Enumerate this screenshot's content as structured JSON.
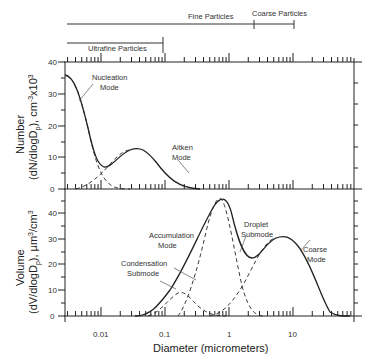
{
  "chart_data": [
    {
      "type": "line",
      "title": "",
      "panel": "number",
      "ylabel_line1": "Number",
      "ylabel_line2": "(dN/dlogDp), cm-3x10^3",
      "xlabel": "",
      "xscale": "log",
      "xlim": [
        0.00275,
        90
      ],
      "ylim": [
        0,
        40
      ],
      "yticks": [
        0,
        10,
        20,
        30,
        40
      ],
      "series": [
        {
          "name": "Total (solid)",
          "x": [
            0.003,
            0.005,
            0.007,
            0.01,
            0.015,
            0.02,
            0.03,
            0.05,
            0.1,
            0.2
          ],
          "y": [
            35,
            27,
            14,
            7,
            9,
            11.5,
            12.5,
            8,
            1.5,
            0
          ]
        },
        {
          "name": "Nucleation Mode (dashed)",
          "x": [
            0.003,
            0.005,
            0.007,
            0.01,
            0.015,
            0.02
          ],
          "y": [
            35,
            27,
            13,
            4,
            1,
            0
          ]
        },
        {
          "name": "Aitken Mode (dashed)",
          "x": [
            0.005,
            0.01,
            0.015,
            0.02,
            0.03,
            0.05,
            0.1
          ],
          "y": [
            0,
            3,
            8,
            11,
            12.5,
            8,
            1.5
          ]
        }
      ],
      "annotations": [
        "Nucleation Mode",
        "Aitken Mode"
      ]
    },
    {
      "type": "line",
      "panel": "volume",
      "ylabel_line1": "Volume",
      "ylabel_line2": "(dV/dlogDp), µm3/cm3",
      "xlabel": "Diameter (micrometers)",
      "xscale": "log",
      "xlim": [
        0.00275,
        90
      ],
      "xticks": [
        "0.01",
        "0.1",
        "1",
        "10"
      ],
      "ylim": [
        0,
        40
      ],
      "yticks": [
        0,
        10,
        20,
        30,
        40
      ],
      "series": [
        {
          "name": "Total (solid)",
          "x": [
            0.05,
            0.1,
            0.2,
            0.4,
            0.7,
            1,
            2,
            3,
            5,
            6,
            10,
            20,
            50
          ],
          "y": [
            0,
            4,
            16,
            34,
            44,
            36,
            16,
            19,
            24,
            25,
            18,
            4,
            0
          ]
        },
        {
          "name": "Condensation Submode (dashed)",
          "x": [
            0.07,
            0.1,
            0.2,
            0.3,
            0.5,
            1
          ],
          "y": [
            0,
            3,
            9,
            8,
            3,
            0
          ]
        },
        {
          "name": "Droplet Submode (dashed)",
          "x": [
            0.15,
            0.3,
            0.5,
            0.7,
            1,
            1.5,
            2,
            3
          ],
          "y": [
            0,
            15,
            38,
            44,
            35,
            14,
            6,
            0
          ]
        },
        {
          "name": "Coarse Mode (dashed)",
          "x": [
            0.5,
            1,
            2,
            4,
            6,
            10,
            20,
            50
          ],
          "y": [
            0,
            2,
            10,
            22,
            25,
            18,
            4,
            0
          ]
        }
      ],
      "annotations": [
        "Accumulation Mode",
        "Condensation Submode",
        "Droplet Submode",
        "Coarse Mode"
      ]
    }
  ],
  "size_ranges": {
    "fine": "Fine Particles",
    "coarse": "Coarse Particles",
    "ultrafine": "Ultrafine Particles"
  },
  "labels": {
    "nucleation1": "Nucleation",
    "nucleation2": "Mode",
    "aitken1": "Aitken",
    "aitken2": "Mode",
    "accum1": "Accumulation",
    "accum2": "Mode",
    "cond1": "Condensation",
    "cond2": "Submode",
    "drop1": "Droplet",
    "drop2": "Submode",
    "coarse1": "Coarse",
    "coarse2": "Mode",
    "num_y1": "Number",
    "vol_y1": "Volume",
    "xlabel": "Diameter (micrometers)"
  },
  "ticks": {
    "y": [
      "0",
      "10",
      "20",
      "30",
      "40"
    ],
    "x": [
      "0.01",
      "0.1",
      "1",
      "10"
    ]
  }
}
